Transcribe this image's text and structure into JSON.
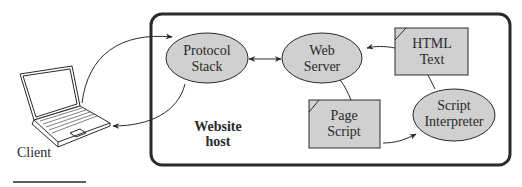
{
  "diagram": {
    "client": {
      "label": "Client"
    },
    "host": {
      "label_line1": "Website",
      "label_line2": "host"
    },
    "nodes": {
      "protocol_stack": {
        "line1": "Protocol",
        "line2": "Stack",
        "shape": "ellipse"
      },
      "web_server": {
        "line1": "Web",
        "line2": "Server",
        "shape": "ellipse"
      },
      "html_text": {
        "line1": "HTML",
        "line2": "Text",
        "shape": "document"
      },
      "page_script": {
        "line1": "Page",
        "line2": "Script",
        "shape": "document"
      },
      "script_interpreter": {
        "line1": "Script",
        "line2": "Interpreter",
        "shape": "ellipse"
      }
    },
    "edges": [
      {
        "from": "client",
        "to": "protocol_stack",
        "directed": true
      },
      {
        "from": "protocol_stack",
        "to": "client",
        "directed": true
      },
      {
        "from": "protocol_stack",
        "to": "web_server",
        "bidirectional": true
      },
      {
        "from": "html_text",
        "to": "web_server",
        "directed": true
      },
      {
        "from": "web_server",
        "to": "page_script",
        "directed": false
      },
      {
        "from": "page_script",
        "to": "script_interpreter",
        "directed": true
      },
      {
        "from": "html_text",
        "to": "script_interpreter",
        "directed": false
      }
    ],
    "colors": {
      "node_fill": "#d0d0d0",
      "stroke": "#2a2a2a",
      "background": "#ffffff"
    }
  }
}
